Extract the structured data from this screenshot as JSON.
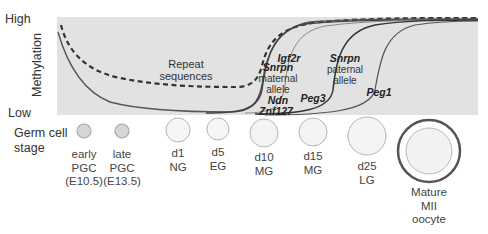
{
  "axis": {
    "high_label": "High",
    "low_label": "Low",
    "y_title": "Methylation"
  },
  "plot": {
    "background": "#e2e2e2",
    "curve_color": "#444444",
    "gene_labels": {
      "repeat_1": "Repeat",
      "repeat_2": "sequences",
      "igf2r": "Igf2r",
      "snrpn_mat_1": "Snrpn",
      "snrpn_mat_2": "maternal",
      "snrpn_mat_3": "allele",
      "ndn": "Ndn",
      "znf127": "Znf127",
      "peg3": "Peg3",
      "snrpn_pat_1": "Snrpn",
      "snrpn_pat_2": "paternal",
      "snrpn_pat_3": "allele",
      "peg1": "Peg1"
    }
  },
  "stage_title": {
    "line1": "Germ cell",
    "line2": "stage"
  },
  "cells": [
    {
      "l1": "early",
      "l2": "PGC",
      "l3": "(E10.5)"
    },
    {
      "l1": "late",
      "l2": "PGC",
      "l3": "(E13.5)"
    },
    {
      "l1": "d1",
      "l2": "NG",
      "l3": ""
    },
    {
      "l1": "d5",
      "l2": "EG",
      "l3": ""
    },
    {
      "l1": "d10",
      "l2": "MG",
      "l3": ""
    },
    {
      "l1": "d15",
      "l2": "MG",
      "l3": ""
    },
    {
      "l1": "d25",
      "l2": "LG",
      "l3": ""
    },
    {
      "l1": "Mature",
      "l2": "MII",
      "l3": "oocyte"
    }
  ]
}
